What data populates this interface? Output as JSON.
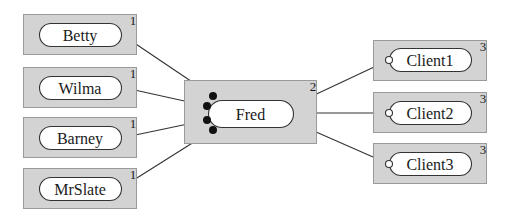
{
  "diagram": {
    "type": "component-connection-graph",
    "colors": {
      "box_fill": "#d3d3d3",
      "box_stroke": "#9a9a9a",
      "pill_fill": "#ffffff",
      "line": "#333333",
      "dot": "#111111"
    },
    "nodes": [
      {
        "id": "betty",
        "label": "Betty",
        "count": "1",
        "box": [
          23,
          14,
          113,
          40
        ],
        "pill": [
          39,
          23,
          82,
          23
        ]
      },
      {
        "id": "wilma",
        "label": "Wilma",
        "count": "1",
        "box": [
          23,
          67,
          113,
          40
        ],
        "pill": [
          39,
          76,
          82,
          23
        ]
      },
      {
        "id": "barney",
        "label": "Barney",
        "count": "1",
        "box": [
          23,
          117,
          113,
          40
        ],
        "pill": [
          39,
          126,
          82,
          23
        ]
      },
      {
        "id": "mrslate",
        "label": "MrSlate",
        "count": "1",
        "box": [
          23,
          168,
          113,
          40
        ],
        "pill": [
          39,
          177,
          82,
          23
        ]
      },
      {
        "id": "fred",
        "label": "Fred",
        "count": "2",
        "box": [
          184,
          80,
          132,
          63
        ],
        "pill": [
          208,
          100,
          85,
          27
        ]
      },
      {
        "id": "client1",
        "label": "Client1",
        "count": "3",
        "box": [
          373,
          40,
          113,
          40
        ],
        "pill": [
          389,
          48,
          82,
          23
        ]
      },
      {
        "id": "client2",
        "label": "Client2",
        "count": "3",
        "box": [
          373,
          92,
          113,
          40
        ],
        "pill": [
          389,
          101,
          82,
          23
        ]
      },
      {
        "id": "client3",
        "label": "Client3",
        "count": "3",
        "box": [
          373,
          143,
          113,
          40
        ],
        "pill": [
          389,
          152,
          82,
          23
        ]
      }
    ],
    "edges": [
      {
        "from": "betty",
        "to": "fred",
        "start": [
          121,
          34
        ],
        "end": [
          213,
          96
        ],
        "end_marker": "filled"
      },
      {
        "from": "wilma",
        "to": "fred",
        "start": [
          121,
          87
        ],
        "end": [
          207,
          106
        ],
        "end_marker": "filled"
      },
      {
        "from": "barney",
        "to": "fred",
        "start": [
          121,
          138
        ],
        "end": [
          207,
          120
        ],
        "end_marker": "filled"
      },
      {
        "from": "mrslate",
        "to": "fred",
        "start": [
          121,
          188
        ],
        "end": [
          213,
          130
        ],
        "end_marker": "filled"
      },
      {
        "from": "fred",
        "to": "client1",
        "start": [
          291,
          106
        ],
        "end": [
          389,
          60
        ],
        "end_marker": "open"
      },
      {
        "from": "fred",
        "to": "client2",
        "start": [
          293,
          113
        ],
        "end": [
          389,
          113
        ],
        "end_marker": "open"
      },
      {
        "from": "fred",
        "to": "client3",
        "start": [
          291,
          121
        ],
        "end": [
          389,
          164
        ],
        "end_marker": "open"
      }
    ]
  }
}
